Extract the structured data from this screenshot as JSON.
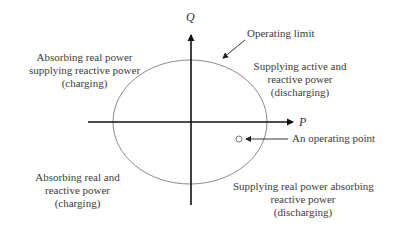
{
  "axes": {
    "x_label": "P",
    "y_label": "Q"
  },
  "annotations": {
    "operating_limit": "Operating limit",
    "operating_point": "An operating point"
  },
  "quadrants": {
    "top_left": {
      "line1": "Absorbing real power",
      "line2": "supplying reactive power",
      "line3": "(charging)"
    },
    "top_right": {
      "line1": "Supplying active and",
      "line2": "reactive power",
      "line3": "(discharging)"
    },
    "bottom_left": {
      "line1": "Absorbing real and",
      "line2": "reactive power",
      "line3": "(charging)"
    },
    "bottom_right": {
      "line1": "Supplying real power absorbing",
      "line2": "reactive power",
      "line3": "(discharging)"
    }
  },
  "colors": {
    "axis": "#111111",
    "ellipse": "#8a8a8a",
    "text": "#3c3c3c"
  }
}
